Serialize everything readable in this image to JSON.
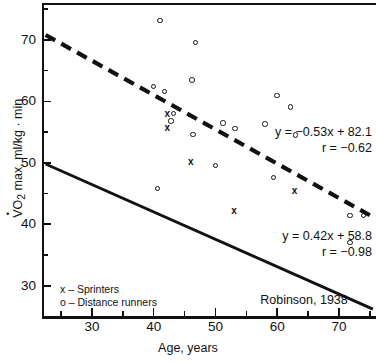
{
  "chart_data": {
    "type": "scatter",
    "title": "",
    "xlabel": "Age, years",
    "ylabel": "VO2 max, ml/kg · min",
    "xlim": [
      22,
      76
    ],
    "ylim": [
      25,
      76
    ],
    "grid": false,
    "x_ticks_major": [
      30,
      40,
      50,
      60,
      70
    ],
    "x_ticks_minor": [
      25,
      35,
      45,
      55,
      65,
      75
    ],
    "y_ticks_major": [
      30,
      40,
      50,
      60,
      70
    ],
    "y_ticks_minor": [
      35,
      45,
      55,
      65,
      75
    ],
    "legend_position": "bottom-left",
    "legend": [
      {
        "marker": "x",
        "label": "x – Sprinters"
      },
      {
        "marker": "o",
        "label": "o – Distance runners"
      }
    ],
    "series": [
      {
        "name": "Distance runners",
        "marker": "circle",
        "points": [
          {
            "x": 41.0,
            "y": 73.2
          },
          {
            "x": 46.8,
            "y": 69.6
          },
          {
            "x": 46.2,
            "y": 63.5
          },
          {
            "x": 40.0,
            "y": 62.4
          },
          {
            "x": 41.8,
            "y": 61.6
          },
          {
            "x": 60.0,
            "y": 61.0
          },
          {
            "x": 62.2,
            "y": 59.1
          },
          {
            "x": 43.2,
            "y": 58.0
          },
          {
            "x": 42.8,
            "y": 56.8
          },
          {
            "x": 51.2,
            "y": 56.5
          },
          {
            "x": 58.0,
            "y": 56.3
          },
          {
            "x": 53.2,
            "y": 55.6
          },
          {
            "x": 46.4,
            "y": 54.6
          },
          {
            "x": 63.0,
            "y": 54.5
          },
          {
            "x": 50.0,
            "y": 49.6
          },
          {
            "x": 59.4,
            "y": 47.6
          },
          {
            "x": 40.6,
            "y": 45.8
          },
          {
            "x": 71.8,
            "y": 41.4
          },
          {
            "x": 74.0,
            "y": 41.4
          },
          {
            "x": 71.8,
            "y": 37.0
          }
        ]
      },
      {
        "name": "Sprinters",
        "marker": "x",
        "points": [
          {
            "x": 42.2,
            "y": 57.9
          },
          {
            "x": 42.2,
            "y": 55.6
          },
          {
            "x": 46.0,
            "y": 50.2
          },
          {
            "x": 53.0,
            "y": 42.2
          },
          {
            "x": 62.8,
            "y": 45.4
          }
        ]
      }
    ],
    "fits": [
      {
        "name": "Distance runners fit",
        "style": "dashed",
        "equation": "y = −0.53x + 82.1",
        "correlation": "r = −0.62",
        "slope": -0.53,
        "intercept": 82.1,
        "r": -0.62,
        "x_from": 22.5,
        "x_to": 75.5,
        "y_from": 70.8,
        "y_to": 41.2
      },
      {
        "name": "Sprinters fit",
        "style": "solid",
        "equation": "y = 0.42x + 58.8",
        "correlation": "r = −0.98",
        "slope": 0.42,
        "intercept": 58.8,
        "r": -0.98,
        "x_from": 22.5,
        "x_to": 75.5,
        "y_from": 49.8,
        "y_to": 26.2
      }
    ],
    "annotations": [
      {
        "name": "source-citation",
        "text": "Robinson, 1938"
      }
    ]
  },
  "axes": {
    "y_title_prefix": "V",
    "y_title_rest": "O",
    "y_title_sub": "2",
    "y_title_tail": " max, ml/kg · min",
    "x_title": "Age, years"
  },
  "equations": {
    "dashed_line": "y = −0.53x + 82.1",
    "dashed_r": "r = −0.62",
    "solid_line": "y = 0.42x + 58.8",
    "solid_r": "r = −0.98"
  },
  "legend": {
    "sprinters": "x – Sprinters",
    "distance_runners": "o – Distance runners"
  },
  "citation": "Robinson, 1938",
  "colors": {
    "ink": "#111111",
    "background": "#ffffff"
  }
}
